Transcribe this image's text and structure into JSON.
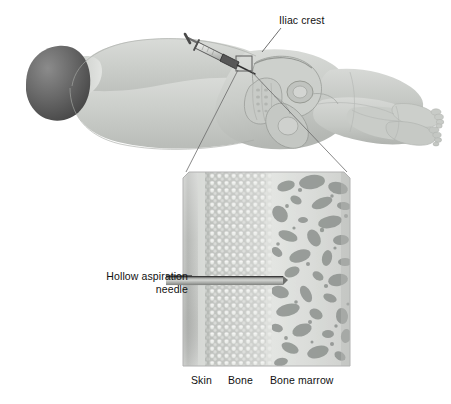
{
  "figure": {
    "type": "medical-illustration"
  },
  "labels": {
    "iliac_crest": "Iliac crest",
    "hollow_aspiration_needle": "Hollow aspiration\nneedle",
    "hollow_aspiration_needle_line1": "Hollow aspiration",
    "hollow_aspiration_needle_line2": "needle",
    "skin": "Skin",
    "bone": "Bone",
    "bone_marrow": "Bone marrow"
  },
  "colors": {
    "background": "#ffffff",
    "text": "#111111",
    "body_fill": "#c6c9c6",
    "body_fill_light": "#d6d8d5",
    "body_outline": "#a8aaa7",
    "head_dark": "#6e6e6e",
    "head_darker": "#4a4a4a",
    "pelvis_fill": "#c3c6c2",
    "pelvis_outline": "#9a9c98",
    "syringe_barrel": "#d9dad8",
    "syringe_hub": "#5a5a5a",
    "syringe_outline": "#3a3a3a",
    "leader_line": "#6a6a6a",
    "panel_border": "#b5b5b5",
    "skin_band": "#b9bbb8",
    "skin_band_light": "#d2d4d1",
    "bone_band": "#c4c6c3",
    "bone_dot": "#eceeeb",
    "marrow_bg": "#dcdedb",
    "marrow_blob": "#8e9290",
    "needle_body": "#b0b2af",
    "needle_top": "#3c3c3c"
  },
  "anatomy": {
    "body_position": "lateral recumbent (side-lying), head left, feet right",
    "regions": [
      "head",
      "torso",
      "hip",
      "thigh",
      "lower leg",
      "foot"
    ],
    "marker_box_label": "aspiration site magnification marker"
  },
  "detail_panel": {
    "layers": [
      "Skin",
      "Bone",
      "Bone marrow"
    ],
    "needle_label": "Hollow aspiration needle",
    "needle_direction": "horizontal, entering from left, tip in marrow"
  }
}
